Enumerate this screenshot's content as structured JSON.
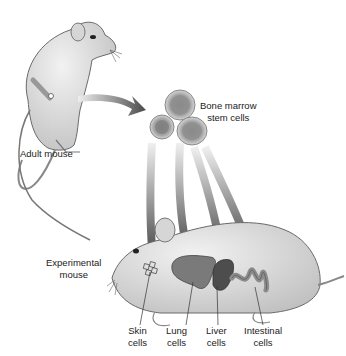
{
  "diagram": {
    "labels": {
      "adult_mouse": "Adult mouse",
      "stem_cells_line1": "Bone marrow",
      "stem_cells_line2": "stem cells",
      "experimental_line1": "Experimental",
      "experimental_line2": "mouse",
      "skin_line1": "Skin",
      "skin_line2": "cells",
      "lung_line1": "Lung",
      "lung_line2": "cells",
      "liver_line1": "Liver",
      "liver_line2": "cells",
      "intestinal_line1": "Intestinal",
      "intestinal_line2": "cells"
    },
    "nodes": [
      {
        "id": "adult-mouse",
        "label": "Adult mouse"
      },
      {
        "id": "stem-cells",
        "label": "Bone marrow stem cells"
      },
      {
        "id": "experimental-mouse",
        "label": "Experimental mouse"
      },
      {
        "id": "skin",
        "label": "Skin cells"
      },
      {
        "id": "lung",
        "label": "Lung cells"
      },
      {
        "id": "liver",
        "label": "Liver cells"
      },
      {
        "id": "intestine",
        "label": "Intestinal cells"
      }
    ],
    "edges": [
      {
        "from": "adult-mouse",
        "to": "stem-cells"
      },
      {
        "from": "stem-cells",
        "to": "skin"
      },
      {
        "from": "stem-cells",
        "to": "lung"
      },
      {
        "from": "stem-cells",
        "to": "liver"
      },
      {
        "from": "stem-cells",
        "to": "intestine"
      }
    ],
    "colors": {
      "mouse_fur": "#d9d9d9",
      "mouse_outline": "#6a6a6a",
      "arrow": "#5a5a5a",
      "organ_lung": "#7a7a7a",
      "organ_liver": "#4d4d4d",
      "organ_intestine": "#8c8c8c",
      "cell_outer": "#bdbdbd",
      "cell_nucleus": "#777777"
    }
  }
}
